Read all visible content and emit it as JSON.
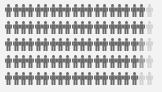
{
  "chart_data": {
    "type": "pictogram",
    "title": "",
    "icon": "person-icon",
    "rows": 5,
    "columns": 20,
    "units_per_icon": 1,
    "colors": {
      "dark": "#6b6b6b",
      "medium": "#9d9d9d",
      "light": "#d2d2d2",
      "background": "#f3f3f3"
    },
    "series": [
      {
        "row": 1,
        "dark": 19,
        "medium": 0,
        "light": 1
      },
      {
        "row": 2,
        "dark": 19,
        "medium": 0,
        "light": 1
      },
      {
        "row": 3,
        "dark": 18,
        "medium": 1,
        "light": 1
      },
      {
        "row": 4,
        "dark": 18,
        "medium": 1,
        "light": 1
      },
      {
        "row": 5,
        "dark": 18,
        "medium": 0,
        "light": 2
      }
    ],
    "totals": {
      "dark": 92,
      "medium": 2,
      "light": 6,
      "total": 100
    }
  }
}
